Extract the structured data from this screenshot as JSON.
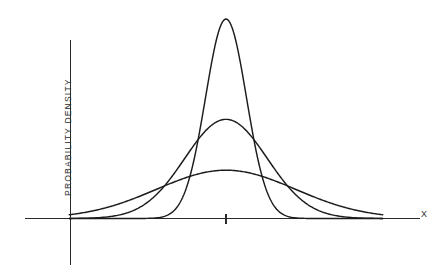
{
  "chart_data": {
    "type": "line",
    "title": "",
    "subtitle": "",
    "xlabel": "X",
    "ylabel": "PROBABILITY DENSITY",
    "grid": false,
    "legend": "none",
    "annotations": [
      "Three normal probability density curves with a common mean and differing standard deviations"
    ],
    "axes": {
      "x_axis_visible": true,
      "y_axis_visible": true,
      "x_tick_labels": [],
      "y_tick_labels": [],
      "center_tick_present": true,
      "center_tick_label": "",
      "xlim": [
        -4.6,
        4.6
      ],
      "ylim": [
        0,
        1.0
      ]
    },
    "x": [
      -4.6,
      -4.3,
      -4.0,
      -3.7,
      -3.4,
      -3.1,
      -2.8,
      -2.5,
      -2.2,
      -1.9,
      -1.6,
      -1.3,
      -1.0,
      -0.7,
      -0.4,
      -0.1,
      0.0,
      0.1,
      0.4,
      0.7,
      1.0,
      1.3,
      1.6,
      1.9,
      2.2,
      2.5,
      2.8,
      3.1,
      3.4,
      3.7,
      4.0,
      4.3,
      4.6
    ],
    "series": [
      {
        "name": "narrow",
        "description": "tall narrow peak, smallest standard deviation",
        "sigma": 0.62,
        "mean": 0.0,
        "peak_value": 1.0,
        "color": "#1c1c1c",
        "values": [
          0.0,
          0.0,
          0.0,
          0.0,
          0.0,
          0.0,
          0.0,
          0.0,
          0.002,
          0.011,
          0.043,
          0.128,
          0.29,
          0.527,
          0.77,
          0.987,
          1.0,
          0.987,
          0.77,
          0.527,
          0.29,
          0.128,
          0.043,
          0.011,
          0.002,
          0.0,
          0.0,
          0.0,
          0.0,
          0.0,
          0.0,
          0.0,
          0.0
        ]
      },
      {
        "name": "medium",
        "description": "intermediate peak and spread",
        "sigma": 1.25,
        "mean": 0.0,
        "peak_value": 0.497,
        "color": "#1c1c1c",
        "values": [
          0.0,
          0.001,
          0.002,
          0.007,
          0.016,
          0.035,
          0.07,
          0.124,
          0.2,
          0.298,
          0.41,
          0.52,
          0.62,
          0.7,
          0.76,
          0.79,
          0.79,
          0.79,
          0.76,
          0.7,
          0.62,
          0.52,
          0.41,
          0.298,
          0.2,
          0.124,
          0.07,
          0.035,
          0.016,
          0.007,
          0.002,
          0.001,
          0.0
        ]
      },
      {
        "name": "wide",
        "description": "low flat peak, largest standard deviation",
        "sigma": 2.1,
        "mean": 0.0,
        "peak_value": 0.242,
        "color": "#1c1c1c",
        "values": [
          0.02,
          0.03,
          0.045,
          0.065,
          0.09,
          0.12,
          0.155,
          0.2,
          0.25,
          0.3,
          0.355,
          0.4,
          0.44,
          0.47,
          0.49,
          0.5,
          0.5,
          0.5,
          0.49,
          0.47,
          0.44,
          0.4,
          0.355,
          0.3,
          0.25,
          0.2,
          0.155,
          0.12,
          0.09,
          0.065,
          0.045,
          0.03,
          0.02
        ]
      }
    ]
  },
  "colors": {
    "background": "#ffffff",
    "axis": "#2b2b2b",
    "curve": "#1c1c1c"
  }
}
